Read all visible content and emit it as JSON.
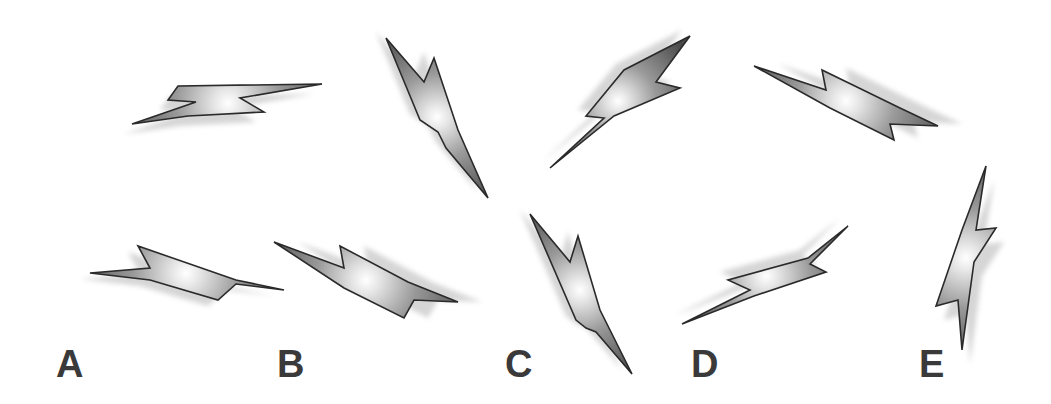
{
  "figure": {
    "width": 1051,
    "height": 404,
    "colors": {
      "bolt_dark": "#4a4a4a",
      "bolt_mid": "#9a9a9a",
      "bolt_light": "#ffffff",
      "outline": "#2a2a2a",
      "shadow": "#cfcfcf",
      "label": "#3a3a3a"
    },
    "bolts": [
      {
        "id": "bolt-top-1",
        "points": [
          [
            132,
            124
          ],
          [
            196,
            102
          ],
          [
            168,
            100
          ],
          [
            178,
            86
          ],
          [
            322,
            84
          ],
          [
            240,
            98
          ],
          [
            264,
            112
          ],
          [
            188,
            116
          ]
        ],
        "shadow_offset": [
          -8,
          10
        ],
        "glow": [
          228,
          103
        ]
      },
      {
        "id": "bolt-top-2",
        "points": [
          [
            386,
            38
          ],
          [
            424,
            82
          ],
          [
            434,
            58
          ],
          [
            458,
            130
          ],
          [
            488,
            198
          ],
          [
            446,
            148
          ],
          [
            438,
            132
          ],
          [
            420,
            120
          ]
        ],
        "shadow_offset": [
          -10,
          -6
        ],
        "glow": [
          437,
          117
        ]
      },
      {
        "id": "bolt-top-3",
        "points": [
          [
            550,
            168
          ],
          [
            604,
            118
          ],
          [
            586,
            116
          ],
          [
            624,
            70
          ],
          [
            690,
            36
          ],
          [
            656,
            82
          ],
          [
            680,
            88
          ],
          [
            614,
            116
          ]
        ],
        "shadow_offset": [
          -8,
          -6
        ],
        "glow": [
          618,
          101
        ]
      },
      {
        "id": "bolt-top-4",
        "points": [
          [
            754,
            66
          ],
          [
            826,
            90
          ],
          [
            822,
            70
          ],
          [
            900,
            108
          ],
          [
            938,
            126
          ],
          [
            890,
            124
          ],
          [
            894,
            140
          ],
          [
            830,
            108
          ]
        ],
        "shadow_offset": [
          24,
          -2
        ],
        "glow": [
          846,
          101
        ]
      },
      {
        "id": "bolt-bottom-A",
        "points": [
          [
            90,
            273
          ],
          [
            150,
            268
          ],
          [
            138,
            246
          ],
          [
            236,
            280
          ],
          [
            284,
            290
          ],
          [
            236,
            284
          ],
          [
            218,
            300
          ],
          [
            150,
            280
          ]
        ],
        "shadow_offset": [
          -10,
          6
        ],
        "glow": [
          186,
          273
        ]
      },
      {
        "id": "bolt-bottom-B",
        "points": [
          [
            274,
            242
          ],
          [
            344,
            268
          ],
          [
            340,
            246
          ],
          [
            408,
            282
          ],
          [
            458,
            302
          ],
          [
            414,
            300
          ],
          [
            404,
            318
          ],
          [
            344,
            288
          ]
        ],
        "shadow_offset": [
          24,
          0
        ],
        "glow": [
          366,
          280
        ]
      },
      {
        "id": "bolt-bottom-C",
        "points": [
          [
            530,
            214
          ],
          [
            570,
            262
          ],
          [
            578,
            236
          ],
          [
            600,
            310
          ],
          [
            632,
            374
          ],
          [
            596,
            332
          ],
          [
            586,
            328
          ],
          [
            576,
            320
          ]
        ],
        "shadow_offset": [
          -10,
          -4
        ],
        "glow": [
          580,
          290
        ]
      },
      {
        "id": "bolt-bottom-D",
        "points": [
          [
            682,
            324
          ],
          [
            750,
            290
          ],
          [
            728,
            280
          ],
          [
            808,
            258
          ],
          [
            848,
            226
          ],
          [
            810,
            264
          ],
          [
            826,
            272
          ],
          [
            754,
            296
          ]
        ],
        "shadow_offset": [
          -8,
          -8
        ],
        "glow": [
          766,
          276
        ]
      },
      {
        "id": "bolt-bottom-E",
        "points": [
          [
            962,
            350
          ],
          [
            958,
            300
          ],
          [
            936,
            306
          ],
          [
            962,
            230
          ],
          [
            986,
            166
          ],
          [
            976,
            230
          ],
          [
            996,
            228
          ],
          [
            974,
            262
          ]
        ],
        "shadow_offset": [
          8,
          14
        ],
        "glow": [
          966,
          258
        ]
      }
    ],
    "labels": [
      {
        "text": "A",
        "x": 56,
        "y": 345
      },
      {
        "text": "B",
        "x": 277,
        "y": 345
      },
      {
        "text": "C",
        "x": 505,
        "y": 345
      },
      {
        "text": "D",
        "x": 691,
        "y": 345
      },
      {
        "text": "E",
        "x": 919,
        "y": 345
      }
    ]
  }
}
